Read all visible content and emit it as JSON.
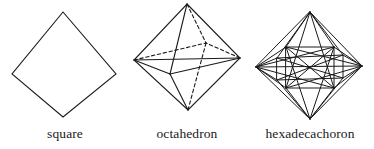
{
  "page": {
    "background_color": "#ffffff",
    "stroke_color": "#1a1a1a"
  },
  "figures": [
    {
      "id": "square",
      "caption": "square",
      "dimension": "2D",
      "vertex_count": 4,
      "edge_count": 4,
      "hidden_edge_style": "none",
      "vertices_px": [
        [
          63,
          12
        ],
        [
          116,
          74
        ],
        [
          63,
          117
        ],
        [
          12,
          74
        ]
      ]
    },
    {
      "id": "octahedron",
      "caption": "octahedron",
      "dimension": "3D",
      "vertex_count": 6,
      "edge_count": 12,
      "hidden_edge_style": "dashed",
      "vertices_px": [
        [
          63,
          4
        ],
        [
          64,
          110
        ],
        [
          10,
          60
        ],
        [
          116,
          58
        ],
        [
          46,
          74
        ],
        [
          82,
          43
        ]
      ]
    },
    {
      "id": "hexadecachoron",
      "caption": "hexadecachoron",
      "dimension": "4D",
      "vertex_count": 8,
      "edge_count": 24,
      "hidden_edge_style": "solid",
      "vertices_px": [
        [
          64,
          12
        ],
        [
          64,
          119
        ],
        [
          10,
          67
        ],
        [
          116,
          66
        ],
        [
          40,
          47
        ],
        [
          88,
          47
        ],
        [
          40,
          88
        ],
        [
          88,
          88
        ]
      ]
    }
  ]
}
